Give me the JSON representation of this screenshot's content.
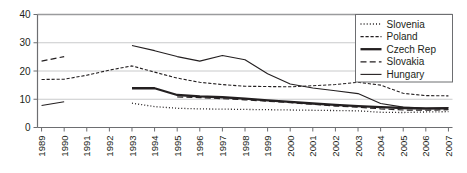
{
  "chart_data": {
    "type": "line",
    "title": "",
    "xlabel": "",
    "ylabel": "",
    "xlim": [
      1989,
      2007
    ],
    "ylim": [
      0,
      40
    ],
    "yticks": [
      0,
      10,
      20,
      30,
      40
    ],
    "grid": true,
    "legend_position": "top-right",
    "x": [
      1989,
      1990,
      1991,
      1992,
      1993,
      1994,
      1995,
      1996,
      1997,
      1998,
      1999,
      2000,
      2001,
      2002,
      2003,
      2004,
      2005,
      2006,
      2007
    ],
    "categories": [
      "1989",
      "1990",
      "1991",
      "1992",
      "1993",
      "1994",
      "1995",
      "1996",
      "1997",
      "1998",
      "1999",
      "2000",
      "2001",
      "2002",
      "2003",
      "2004",
      "2005",
      "2006",
      "2007"
    ],
    "series": [
      {
        "name": "Slovenia",
        "style": "dotted",
        "color": "#231f20",
        "values": [
          null,
          null,
          null,
          null,
          8.6,
          7.4,
          6.8,
          6.6,
          6.5,
          6.4,
          6.3,
          6.2,
          6.1,
          6.0,
          5.9,
          5.4,
          5.3,
          5.5,
          5.6
        ]
      },
      {
        "name": "Poland",
        "style": "dashed",
        "color": "#231f20",
        "values": [
          17.0,
          17.1,
          18.5,
          20.3,
          21.8,
          19.6,
          17.5,
          16.0,
          15.2,
          14.6,
          14.5,
          14.4,
          14.8,
          15.2,
          16.0,
          15.0,
          12.1,
          11.3,
          11.2
        ]
      },
      {
        "name": "Czech Rep",
        "style": "solid-bold",
        "color": "#231f20",
        "values": [
          null,
          null,
          null,
          null,
          13.9,
          13.9,
          11.5,
          11.0,
          10.7,
          10.2,
          9.6,
          9.1,
          8.5,
          8.0,
          7.6,
          7.2,
          6.9,
          6.7,
          6.8
        ]
      },
      {
        "name": "Slovakia",
        "style": "long-dashed",
        "color": "#231f20",
        "values": [
          23.5,
          25.1,
          null,
          null,
          null,
          null,
          10.8,
          10.6,
          10.2,
          9.8,
          9.3,
          8.8,
          8.2,
          7.6,
          7.2,
          6.6,
          6.2,
          6.1,
          6.3
        ]
      },
      {
        "name": "Hungary",
        "style": "solid-thin",
        "color": "#231f20",
        "values": [
          7.8,
          9.1,
          null,
          null,
          29.0,
          27.2,
          25.1,
          23.5,
          25.5,
          24.0,
          19.0,
          15.4,
          14.0,
          13.0,
          12.0,
          8.5,
          7.2,
          6.9,
          7.1
        ]
      }
    ]
  },
  "legend": {
    "entries": [
      {
        "label": "Slovenia",
        "swatch": "dotted-line-swatch"
      },
      {
        "label": "Poland",
        "swatch": "dashed-line-swatch"
      },
      {
        "label": "Czech Rep",
        "swatch": "solid-bold-line-swatch"
      },
      {
        "label": "Slovakia",
        "swatch": "long-dashed-line-swatch"
      },
      {
        "label": "Hungary",
        "swatch": "solid-thin-line-swatch"
      }
    ]
  },
  "axes": {
    "y_labels": [
      "40",
      "30",
      "20",
      "10",
      "0"
    ],
    "x_labels": [
      "1989",
      "1990",
      "1991",
      "1992",
      "1993",
      "1994",
      "1995",
      "1996",
      "1997",
      "1998",
      "1999",
      "2000",
      "2001",
      "2002",
      "2003",
      "2004",
      "2005",
      "2006",
      "2007"
    ]
  },
  "colors": {
    "ink": "#231f20",
    "grid": "#c9cacb",
    "axis": "#6d6e71",
    "background": "#ffffff"
  }
}
